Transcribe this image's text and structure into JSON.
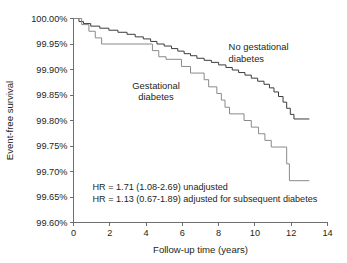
{
  "chart_data": {
    "type": "line",
    "subtype": "kaplan-meier-step",
    "title": "",
    "xlabel": "Follow-up time (years)",
    "ylabel": "Event-free survival",
    "xlim": [
      0,
      14
    ],
    "ylim": [
      99.6,
      100.0
    ],
    "grid": false,
    "legend_position": "inline-labels",
    "xticks": [
      0,
      2,
      4,
      6,
      8,
      10,
      12,
      14
    ],
    "xtick_labels": [
      "0",
      "2",
      "4",
      "6",
      "8",
      "10",
      "12",
      "14"
    ],
    "yticks": [
      99.6,
      99.65,
      99.7,
      99.75,
      99.8,
      99.85,
      99.9,
      99.95,
      100.0
    ],
    "ytick_labels": [
      "99.60%",
      "99.65%",
      "99.70%",
      "99.75%",
      "99.80%",
      "99.85%",
      "99.90%",
      "99.95%",
      "100.00%"
    ],
    "series": [
      {
        "name": "No gestational diabetes",
        "color": "#3c3c3c",
        "label_x": 8.55,
        "label_y": 99.938,
        "points": [
          [
            0.0,
            100.0
          ],
          [
            0.3,
            100.0
          ],
          [
            0.3,
            99.994
          ],
          [
            0.55,
            99.994
          ],
          [
            0.55,
            99.99
          ],
          [
            0.95,
            99.99
          ],
          [
            0.95,
            99.985
          ],
          [
            1.45,
            99.985
          ],
          [
            1.45,
            99.981
          ],
          [
            1.95,
            99.981
          ],
          [
            1.95,
            99.977
          ],
          [
            2.45,
            99.977
          ],
          [
            2.45,
            99.973
          ],
          [
            2.95,
            99.973
          ],
          [
            2.95,
            99.969
          ],
          [
            3.4,
            99.969
          ],
          [
            3.4,
            99.964
          ],
          [
            3.85,
            99.964
          ],
          [
            3.85,
            99.96
          ],
          [
            4.25,
            99.96
          ],
          [
            4.25,
            99.955
          ],
          [
            4.6,
            99.955
          ],
          [
            4.6,
            99.95
          ],
          [
            5.0,
            99.95
          ],
          [
            5.0,
            99.946
          ],
          [
            5.4,
            99.946
          ],
          [
            5.4,
            99.941
          ],
          [
            5.75,
            99.941
          ],
          [
            5.75,
            99.936
          ],
          [
            6.1,
            99.936
          ],
          [
            6.1,
            99.931
          ],
          [
            6.45,
            99.931
          ],
          [
            6.45,
            99.927
          ],
          [
            6.8,
            99.927
          ],
          [
            6.8,
            99.922
          ],
          [
            7.2,
            99.922
          ],
          [
            7.2,
            99.918
          ],
          [
            7.6,
            99.918
          ],
          [
            7.6,
            99.914
          ],
          [
            8.0,
            99.914
          ],
          [
            8.0,
            99.909
          ],
          [
            8.4,
            99.909
          ],
          [
            8.4,
            99.904
          ],
          [
            8.75,
            99.904
          ],
          [
            8.75,
            99.899
          ],
          [
            9.1,
            99.899
          ],
          [
            9.1,
            99.894
          ],
          [
            9.45,
            99.894
          ],
          [
            9.45,
            99.889
          ],
          [
            9.8,
            99.889
          ],
          [
            9.8,
            99.883
          ],
          [
            10.15,
            99.883
          ],
          [
            10.15,
            99.877
          ],
          [
            10.5,
            99.877
          ],
          [
            10.5,
            99.871
          ],
          [
            10.8,
            99.871
          ],
          [
            10.8,
            99.864
          ],
          [
            11.05,
            99.864
          ],
          [
            11.05,
            99.856
          ],
          [
            11.3,
            99.856
          ],
          [
            11.3,
            99.847
          ],
          [
            11.55,
            99.847
          ],
          [
            11.55,
            99.836
          ],
          [
            11.75,
            99.836
          ],
          [
            11.75,
            99.824
          ],
          [
            11.95,
            99.824
          ],
          [
            11.95,
            99.812
          ],
          [
            12.15,
            99.812
          ],
          [
            12.15,
            99.803
          ],
          [
            13.0,
            99.803
          ]
        ]
      },
      {
        "name": "Gestational diabetes",
        "color": "#8a8a8a",
        "label_x": 4.55,
        "label_y": 99.862,
        "points": [
          [
            0.0,
            100.0
          ],
          [
            0.45,
            100.0
          ],
          [
            0.45,
            99.988
          ],
          [
            0.85,
            99.988
          ],
          [
            0.85,
            99.975
          ],
          [
            1.2,
            99.975
          ],
          [
            1.2,
            99.962
          ],
          [
            1.55,
            99.962
          ],
          [
            1.55,
            99.95
          ],
          [
            4.35,
            99.95
          ],
          [
            4.35,
            99.937
          ],
          [
            4.7,
            99.937
          ],
          [
            4.7,
            99.925
          ],
          [
            5.1,
            99.925
          ],
          [
            5.1,
            99.92
          ],
          [
            5.95,
            99.92
          ],
          [
            5.95,
            99.906
          ],
          [
            6.45,
            99.906
          ],
          [
            6.45,
            99.893
          ],
          [
            7.2,
            99.893
          ],
          [
            7.2,
            99.88
          ],
          [
            7.45,
            99.88
          ],
          [
            7.45,
            99.866
          ],
          [
            7.9,
            99.866
          ],
          [
            7.9,
            99.853
          ],
          [
            8.15,
            99.853
          ],
          [
            8.15,
            99.84
          ],
          [
            8.35,
            99.84
          ],
          [
            8.35,
            99.826
          ],
          [
            8.6,
            99.826
          ],
          [
            8.6,
            99.813
          ],
          [
            9.4,
            99.813
          ],
          [
            9.4,
            99.8
          ],
          [
            9.8,
            99.8
          ],
          [
            9.8,
            99.787
          ],
          [
            10.2,
            99.787
          ],
          [
            10.2,
            99.774
          ],
          [
            10.55,
            99.774
          ],
          [
            10.55,
            99.761
          ],
          [
            10.9,
            99.761
          ],
          [
            10.9,
            99.748
          ],
          [
            11.75,
            99.748
          ],
          [
            11.75,
            99.715
          ],
          [
            11.9,
            99.715
          ],
          [
            11.9,
            99.682
          ],
          [
            13.0,
            99.682
          ]
        ]
      }
    ],
    "annotations": [
      {
        "text": "HR = 1.71 (1.08-2.69) unadjusted",
        "x": 1.05,
        "y": 99.663
      },
      {
        "text": "HR = 1.13 (0.67-1.89) adjusted for subsequent diabetes",
        "x": 1.05,
        "y": 99.641
      }
    ]
  }
}
